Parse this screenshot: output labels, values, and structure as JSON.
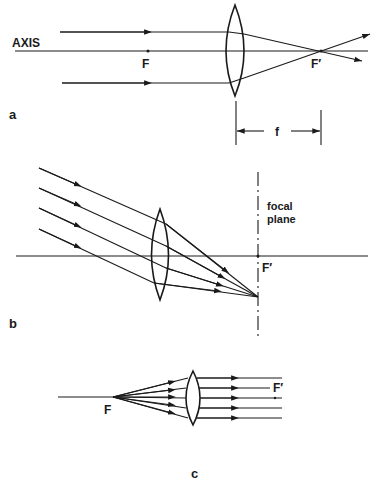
{
  "figure": {
    "panels": [
      {
        "id": "a",
        "label": "a",
        "axis_label": "AXIS",
        "front_focus_label": "F",
        "back_focus_label": "F′",
        "focal_length_label": "f"
      },
      {
        "id": "b",
        "label": "b",
        "focal_plane_label_line1": "focal",
        "focal_plane_label_line2": "plane",
        "back_focus_label": "F′"
      },
      {
        "id": "c",
        "label": "c",
        "front_focus_label": "F",
        "back_focus_label": "F′"
      }
    ]
  }
}
